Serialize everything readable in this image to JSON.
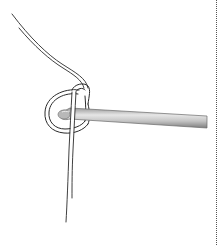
{
  "figure": {
    "colors": {
      "background": "#ffffff",
      "yarn_outline": "#2a2a2a",
      "yarn_fill": "#ffffff",
      "hook_dark": "#8a8a8a",
      "hook_light": "#d8d8d8",
      "hook_mid": "#b0b0b0",
      "border": "#555555"
    },
    "icons": [
      "yarn-strand-icon",
      "crochet-hook-icon",
      "slip-knot-loop-icon"
    ]
  }
}
